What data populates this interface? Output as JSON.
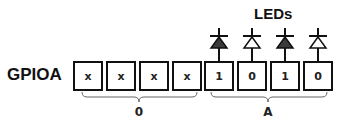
{
  "title": "LEDs",
  "register": {
    "name": "GPIOA"
  },
  "bits": [
    {
      "value": "x",
      "x": 73
    },
    {
      "value": "x",
      "x": 106
    },
    {
      "value": "x",
      "x": 139
    },
    {
      "value": "x",
      "x": 172
    },
    {
      "value": "1",
      "x": 204,
      "led": "on"
    },
    {
      "value": "0",
      "x": 237,
      "led": "off"
    },
    {
      "value": "1",
      "x": 270,
      "led": "on"
    },
    {
      "value": "0",
      "x": 303,
      "led": "off"
    }
  ],
  "groups": [
    {
      "label": "0",
      "from_bit": 0,
      "to_bit": 3
    },
    {
      "label": "A",
      "from_bit": 4,
      "to_bit": 7
    }
  ],
  "colors": {
    "led_on_fill": "#3a3a3a",
    "led_off_fill": "#ffffff",
    "stroke": "#111111"
  }
}
